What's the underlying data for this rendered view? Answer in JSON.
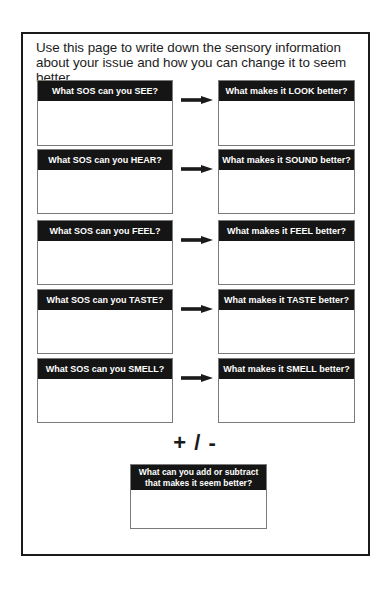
{
  "worksheet": {
    "intro_text": "Use this page to write down the sensory information about your issue and how you can change it to seem better.",
    "rows": [
      {
        "sense": "see",
        "prompt": "What SOS can you SEE?",
        "response": "What makes it LOOK better?",
        "arrow_icon": "right-arrow"
      },
      {
        "sense": "hear",
        "prompt": "What SOS can you HEAR?",
        "response": "What makes it SOUND better?",
        "arrow_icon": "right-arrow"
      },
      {
        "sense": "feel",
        "prompt": "What SOS can you FEEL?",
        "response": "What makes it FEEL better?",
        "arrow_icon": "right-arrow"
      },
      {
        "sense": "taste",
        "prompt": "What SOS can you TASTE?",
        "response": "What makes it TASTE better?",
        "arrow_icon": "right-arrow"
      },
      {
        "sense": "smell",
        "prompt": "What SOS can you SMELL?",
        "response": "What makes it SMELL better?",
        "arrow_icon": "right-arrow"
      }
    ],
    "plus_minus_label": "+ / -",
    "add_subtract_box": {
      "prompt": "What can you add or subtract that makes it seem better?"
    },
    "colors": {
      "header_bg": "#151515",
      "header_text": "#ffffff",
      "border": "#1a1a1a",
      "box_border": "#7a7a7a"
    }
  }
}
